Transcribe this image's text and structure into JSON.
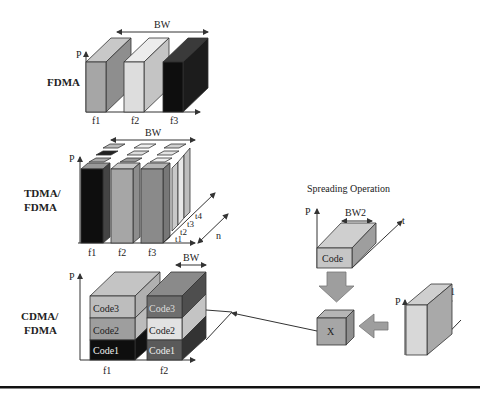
{
  "rows": {
    "fdma": {
      "label": "FDMA",
      "bw": "BW",
      "axis_p": "P",
      "freqs": [
        "f1",
        "f2",
        "f3"
      ]
    },
    "tdma": {
      "label_line1": "TDMA/",
      "label_line2": "FDMA",
      "bw": "BW",
      "axis_p": "P",
      "freqs": [
        "f1",
        "f2",
        "f3"
      ],
      "times": [
        "t1",
        "t2",
        "t3",
        "t4"
      ],
      "n": "n"
    },
    "cdma": {
      "label_line1": "CDMA/",
      "label_line2": "FDMA",
      "bw": "BW",
      "axis_p": "P",
      "freqs": [
        "f1",
        "f2"
      ],
      "codes_f1": [
        "Code3",
        "Code2",
        "Code1"
      ],
      "codes_f2": [
        "Code3",
        "Code2",
        "Code1"
      ]
    }
  },
  "spreading": {
    "title": "Spreading Operation",
    "axis_p": "P",
    "axis_t": "t",
    "bw": "BW2",
    "block": "Code",
    "multiplier": "X"
  },
  "signal": {
    "axis_p": "P",
    "bw": "BW1"
  },
  "colors": {
    "light": "#d9d9d9",
    "mid": "#a8a8a8",
    "dark": "#7a7a7a",
    "black": "#111111"
  }
}
